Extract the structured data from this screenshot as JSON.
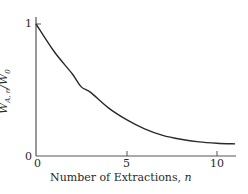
{
  "chart_data": {
    "type": "line",
    "title": "",
    "xlabel": "Number of Extractions, n",
    "ylabel": "W_{A,n}/W_0",
    "xlim": [
      0,
      11
    ],
    "ylim": [
      0,
      1
    ],
    "x_ticks": [
      "0",
      "5",
      "10"
    ],
    "y_ticks": [
      "0",
      "1"
    ],
    "grid": false,
    "legend": null,
    "series": [
      {
        "name": "fraction remaining",
        "x": [
          0,
          1,
          2,
          2.5,
          3,
          4,
          5,
          6,
          7,
          8,
          9,
          10,
          11
        ],
        "y": [
          1.0,
          0.79,
          0.62,
          0.52,
          0.48,
          0.36,
          0.27,
          0.2,
          0.15,
          0.12,
          0.1,
          0.09,
          0.085
        ]
      }
    ]
  },
  "axes": {
    "x_label_main": "Number of Extractions, ",
    "x_label_var": "n",
    "y_label": "W",
    "y_label_sub": "A, n",
    "y_label_den": "/W",
    "y_label_den_sub": "0",
    "x_tick_0": "0",
    "x_tick_5": "5",
    "x_tick_10": "10",
    "y_tick_0": "0",
    "y_tick_1": "1"
  }
}
